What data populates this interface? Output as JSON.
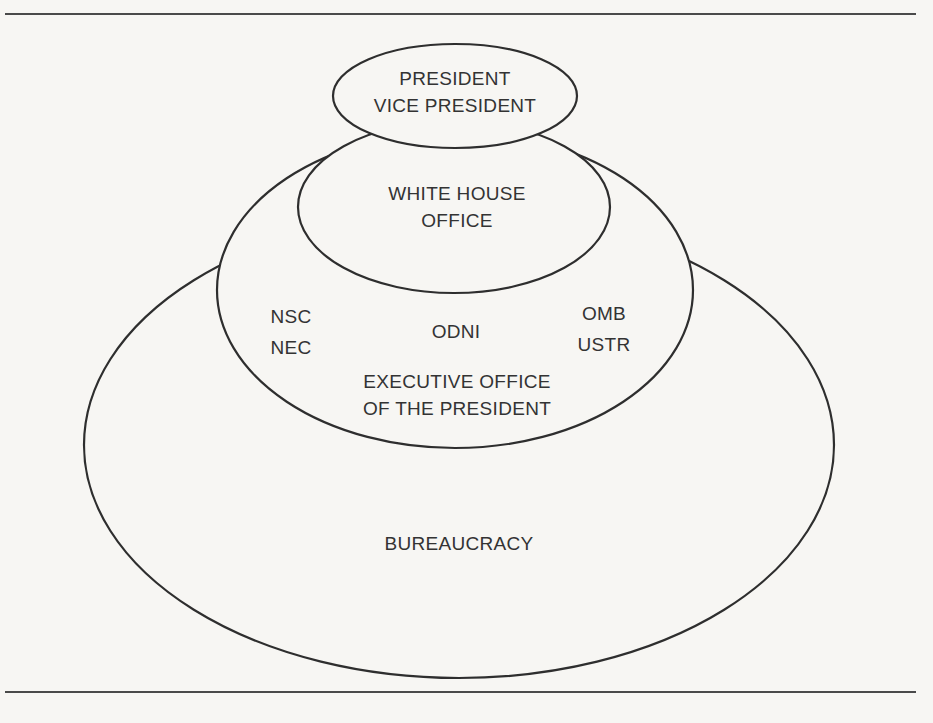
{
  "diagram": {
    "type": "nested-ellipses",
    "stroke_color": "#2e2e2e",
    "background_color": "#f7f6f3",
    "levels": [
      {
        "id": "president",
        "lines": [
          "PRESIDENT",
          "VICE PRESIDENT"
        ]
      },
      {
        "id": "white-house-office",
        "lines": [
          "WHITE HOUSE",
          "OFFICE"
        ]
      },
      {
        "id": "eop",
        "lines": [
          "EXECUTIVE OFFICE",
          "OF THE PRESIDENT"
        ],
        "members": {
          "left": [
            "NSC",
            "NEC"
          ],
          "center": [
            "ODNI"
          ],
          "right": [
            "OMB",
            "USTR"
          ]
        }
      },
      {
        "id": "bureaucracy",
        "lines": [
          "BUREAUCRACY"
        ]
      }
    ]
  }
}
